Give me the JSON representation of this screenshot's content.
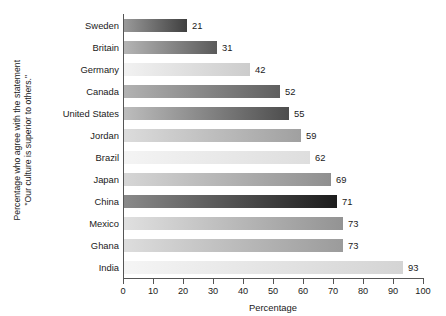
{
  "chart_data": {
    "type": "bar",
    "orientation": "horizontal",
    "title": "",
    "xlabel": "Percentage",
    "ylabel_line1": "Percentage who agree with the statement",
    "ylabel_line2": "\"Our culture is superior to others.\"",
    "categories": [
      "Sweden",
      "Britain",
      "Germany",
      "Canada",
      "United States",
      "Jordan",
      "Brazil",
      "Japan",
      "China",
      "Mexico",
      "Ghana",
      "India"
    ],
    "values": [
      21,
      31,
      42,
      52,
      55,
      59,
      62,
      69,
      71,
      73,
      73,
      93
    ],
    "xlim": [
      0,
      100
    ],
    "xticks": [
      0,
      10,
      20,
      30,
      40,
      50,
      60,
      70,
      80,
      90,
      100
    ],
    "xticklabels": [
      "0",
      "10",
      "20",
      "30",
      "40",
      "50",
      "60",
      "70",
      "80",
      "90",
      "100"
    ],
    "grid": false,
    "legend": false,
    "bar_gradients": [
      {
        "category": "Sweden",
        "from": "#9a9a9a",
        "to": "#3f3f3f"
      },
      {
        "category": "Britain",
        "from": "#b5b5b5",
        "to": "#5a5a5a"
      },
      {
        "category": "Germany",
        "from": "#f2f2f2",
        "to": "#cccccc"
      },
      {
        "category": "Canada",
        "from": "#b2b2b2",
        "to": "#5f5f5f"
      },
      {
        "category": "United States",
        "from": "#bdbdbd",
        "to": "#4d4d4d"
      },
      {
        "category": "Jordan",
        "from": "#dcdcdc",
        "to": "#a0a0a0"
      },
      {
        "category": "Brazil",
        "from": "#f4f4f4",
        "to": "#dedede"
      },
      {
        "category": "Japan",
        "from": "#d6d6d6",
        "to": "#8f8f8f"
      },
      {
        "category": "China",
        "from": "#8a8a8a",
        "to": "#1c1c1c"
      },
      {
        "category": "Mexico",
        "from": "#e0e0e0",
        "to": "#939393"
      },
      {
        "category": "Ghana",
        "from": "#dddddd",
        "to": "#9b9b9b"
      },
      {
        "category": "India",
        "from": "#f5f5f5",
        "to": "#d4d4d4"
      }
    ],
    "axis_color": "#555555",
    "text_color": "#1a1a1a"
  }
}
